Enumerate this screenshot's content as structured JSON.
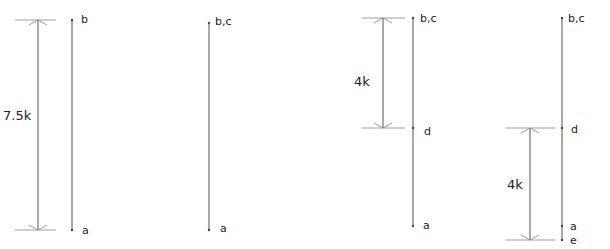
{
  "panels": [
    {
      "id": "panel-1",
      "dimension": {
        "label": "7.5k",
        "x": 38,
        "y1": 20,
        "y2": 230,
        "tick_x1": 15,
        "tick_x2": 56,
        "label_x": 3,
        "label_y": 120
      },
      "axis": {
        "x": 72,
        "y1": 20,
        "y2": 230
      },
      "points": [
        {
          "label": "b",
          "y": 20,
          "label_x": 81,
          "label_y": 23
        },
        {
          "label": "a",
          "y": 230,
          "label_x": 82,
          "label_y": 234
        }
      ]
    },
    {
      "id": "panel-2",
      "dimension": null,
      "axis": {
        "x": 209,
        "y1": 23,
        "y2": 230
      },
      "points": [
        {
          "label": "b,c",
          "y": 23,
          "label_x": 215,
          "label_y": 25
        },
        {
          "label": "a",
          "y": 230,
          "label_x": 220,
          "label_y": 232
        }
      ]
    },
    {
      "id": "panel-3",
      "dimension": {
        "label": "4k",
        "x": 383,
        "y1": 18,
        "y2": 128,
        "tick_x1": 362,
        "tick_x2": 405,
        "label_x": 354,
        "label_y": 86
      },
      "axis": {
        "x": 413,
        "y1": 18,
        "y2": 226
      },
      "points": [
        {
          "label": "b,c",
          "y": 18,
          "label_x": 420,
          "label_y": 22
        },
        {
          "label": "d",
          "y": 128,
          "label_x": 424,
          "label_y": 135
        },
        {
          "label": "a",
          "y": 226,
          "label_x": 423,
          "label_y": 229
        }
      ]
    },
    {
      "id": "panel-4",
      "dimension": {
        "label": "4k",
        "x": 530,
        "y1": 128,
        "y2": 240,
        "tick_x1": 506,
        "tick_x2": 555,
        "label_x": 507,
        "label_y": 189
      },
      "axis": {
        "x": 562,
        "y1": 18,
        "y2": 240
      },
      "points": [
        {
          "label": "b,c",
          "y": 18,
          "label_x": 568,
          "label_y": 22
        },
        {
          "label": "d",
          "y": 128,
          "label_x": 571,
          "label_y": 133
        },
        {
          "label": "a",
          "y": 226,
          "label_x": 570,
          "label_y": 230
        },
        {
          "label": "e",
          "y": 240,
          "label_x": 570,
          "label_y": 244
        }
      ]
    }
  ]
}
